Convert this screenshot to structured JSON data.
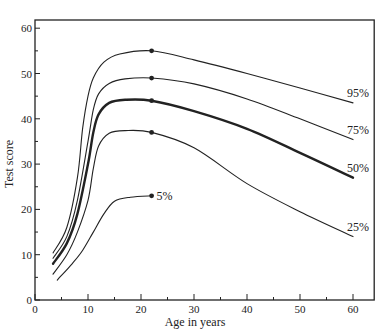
{
  "chart_data": {
    "type": "line",
    "title": "",
    "xlabel": "Age in years",
    "ylabel": "Test score",
    "xlim": [
      0,
      64
    ],
    "ylim": [
      0,
      65
    ],
    "x_ticks": [
      0,
      10,
      20,
      30,
      40,
      50,
      60
    ],
    "y_ticks": [
      0,
      10,
      20,
      30,
      40,
      50,
      60
    ],
    "grid": false,
    "legend": "inline labels at right end of curves",
    "series": [
      {
        "name": "95%",
        "label": "95%",
        "width": 1.1,
        "points": [
          [
            3.4,
            10.4
          ],
          [
            6,
            16
          ],
          [
            8,
            27
          ],
          [
            9,
            38
          ],
          [
            10,
            45
          ],
          [
            11,
            49
          ],
          [
            13,
            52.5
          ],
          [
            16,
            54.3
          ],
          [
            22,
            55
          ],
          [
            30,
            53
          ],
          [
            40,
            50
          ],
          [
            50,
            46.8
          ],
          [
            60,
            43.5
          ]
        ],
        "marker": [
          22,
          55
        ]
      },
      {
        "name": "75%",
        "label": "75%",
        "width": 1.1,
        "points": [
          [
            3.4,
            9.2
          ],
          [
            6,
            14
          ],
          [
            8,
            22
          ],
          [
            10,
            35
          ],
          [
            11,
            42
          ],
          [
            12,
            45.5
          ],
          [
            14,
            47.8
          ],
          [
            17,
            48.8
          ],
          [
            22,
            49
          ],
          [
            30,
            47.7
          ],
          [
            40,
            44.4
          ],
          [
            50,
            40
          ],
          [
            60,
            35.4
          ]
        ],
        "marker": [
          22,
          49
        ]
      },
      {
        "name": "50%",
        "label": "50%",
        "width": 2.4,
        "points": [
          [
            3.4,
            8
          ],
          [
            6,
            12.5
          ],
          [
            8,
            19
          ],
          [
            10,
            30
          ],
          [
            11,
            37
          ],
          [
            12,
            41
          ],
          [
            14,
            43.5
          ],
          [
            17,
            44.2
          ],
          [
            22,
            44
          ],
          [
            30,
            41.7
          ],
          [
            40,
            37.8
          ],
          [
            50,
            32.5
          ],
          [
            60,
            27
          ]
        ],
        "marker": [
          22,
          44
        ]
      },
      {
        "name": "25%",
        "label": "25%",
        "width": 1.1,
        "points": [
          [
            3.4,
            5.7
          ],
          [
            6,
            10
          ],
          [
            8,
            15
          ],
          [
            10,
            22
          ],
          [
            11,
            29
          ],
          [
            12,
            34
          ],
          [
            14,
            36.8
          ],
          [
            17,
            37.4
          ],
          [
            22,
            37
          ],
          [
            30,
            33.6
          ],
          [
            40,
            25.7
          ],
          [
            50,
            19.5
          ],
          [
            60,
            14
          ]
        ],
        "marker": [
          22,
          37
        ]
      },
      {
        "name": "5%",
        "label": "5%",
        "width": 1.1,
        "points": [
          [
            4.2,
            4.4
          ],
          [
            7,
            8
          ],
          [
            9,
            11
          ],
          [
            11,
            15
          ],
          [
            13,
            19
          ],
          [
            15,
            21.8
          ],
          [
            18,
            22.7
          ],
          [
            22,
            23
          ]
        ],
        "marker": [
          22,
          23
        ]
      }
    ]
  }
}
